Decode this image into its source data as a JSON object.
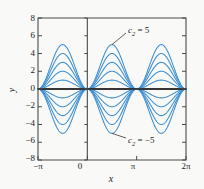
{
  "chart_data": {
    "type": "line",
    "title": "",
    "xlabel": "x",
    "ylabel": "y",
    "xlim": [
      -3.14159265,
      6.28318531
    ],
    "ylim": [
      -8,
      8
    ],
    "grid": false,
    "legend": null,
    "x_tick_values": [
      -3.14159265,
      0,
      3.14159265,
      6.28318531
    ],
    "x_tick_labels": [
      "−π",
      "0",
      "π",
      "2π"
    ],
    "y_tick_values": [
      8,
      6,
      4,
      2,
      0,
      -2,
      -4,
      -6,
      -8
    ],
    "y_tick_labels": [
      "8",
      "6",
      "4",
      "2",
      "0",
      "−2",
      "−4",
      "−6",
      "−8"
    ],
    "function": "y = c2 * sin(x)^2 * sign(sin(x))",
    "parameter_name": "c₂",
    "parameter_values": [
      5,
      4,
      3,
      2,
      1,
      0,
      -1,
      -2,
      -3,
      -4,
      -5
    ],
    "series": [
      {
        "name": "c2 = 5",
        "c2": 5,
        "amplitude": 5
      },
      {
        "name": "c2 = 4",
        "c2": 4,
        "amplitude": 4
      },
      {
        "name": "c2 = 3",
        "c2": 3,
        "amplitude": 3
      },
      {
        "name": "c2 = 2",
        "c2": 2,
        "amplitude": 2
      },
      {
        "name": "c2 = 1",
        "c2": 1,
        "amplitude": 1
      },
      {
        "name": "c2 = 0",
        "c2": 0,
        "amplitude": 0
      },
      {
        "name": "c2 = -1",
        "c2": -1,
        "amplitude": -1
      },
      {
        "name": "c2 = -2",
        "c2": -2,
        "amplitude": -2
      },
      {
        "name": "c2 = -3",
        "c2": -3,
        "amplitude": -3
      },
      {
        "name": "c2 = -4",
        "c2": -4,
        "amplitude": -4
      },
      {
        "name": "c2 = -5",
        "c2": -5,
        "amplitude": -5
      }
    ],
    "annotations": [
      {
        "id": "upper",
        "text_prefix": "c",
        "text_sub": "2",
        "text_suffix": " = 5",
        "label": "c₂ = 5",
        "target_x": 1.57,
        "target_y": 5
      },
      {
        "id": "lower",
        "text_prefix": "c",
        "text_sub": "2",
        "text_suffix": " = −5",
        "label": "c₂ = −5",
        "target_x": 1.57,
        "target_y": -5
      }
    ],
    "colors": {
      "curve": "#3d8fd1",
      "curve_light": "#9cc8e8",
      "axis": "#2a2a2a",
      "frame": "#4a4a4a",
      "text": "#1c1c1c",
      "background": "#f9f9f7"
    }
  },
  "axes": {
    "y_title": "y",
    "x_title": "x"
  }
}
